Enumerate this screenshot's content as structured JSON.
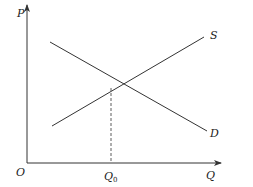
{
  "diagram": {
    "title": "",
    "axes": {
      "y_label": "P",
      "x_label": "Q",
      "origin_label": "O"
    },
    "curves": [
      {
        "name": "S",
        "label": "S",
        "type": "supply",
        "x1": 52,
        "y1": 126,
        "x2": 204,
        "y2": 37
      },
      {
        "name": "D",
        "label": "D",
        "type": "demand",
        "x1": 50,
        "y1": 42,
        "x2": 207,
        "y2": 131
      }
    ],
    "equilibrium": {
      "x": 111,
      "y": 88,
      "q_label_main": "Q",
      "q_label_sub": "0"
    },
    "colors": {
      "line": "#333333",
      "axis": "#333333",
      "background": "#ffffff"
    }
  }
}
